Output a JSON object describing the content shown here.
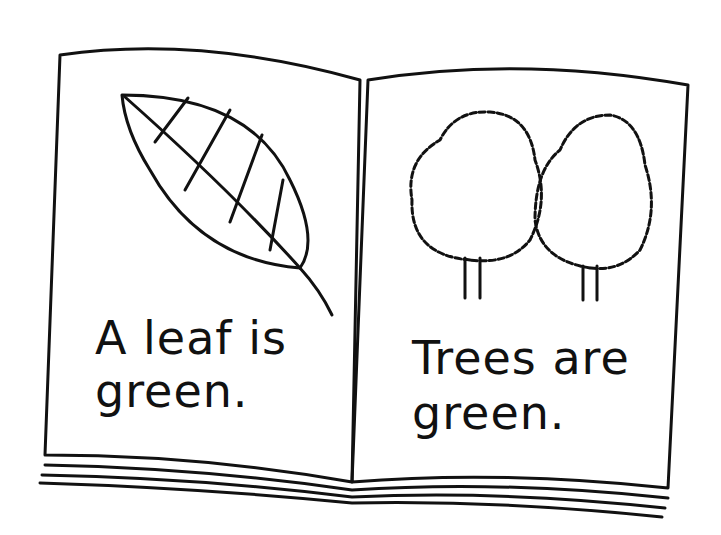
{
  "illustration": {
    "subject": "open book",
    "left_page": {
      "line1": "A leaf is",
      "line2": "green.",
      "picture": "leaf"
    },
    "right_page": {
      "line1": "Trees are",
      "line2": "green.",
      "picture": "two trees"
    }
  }
}
